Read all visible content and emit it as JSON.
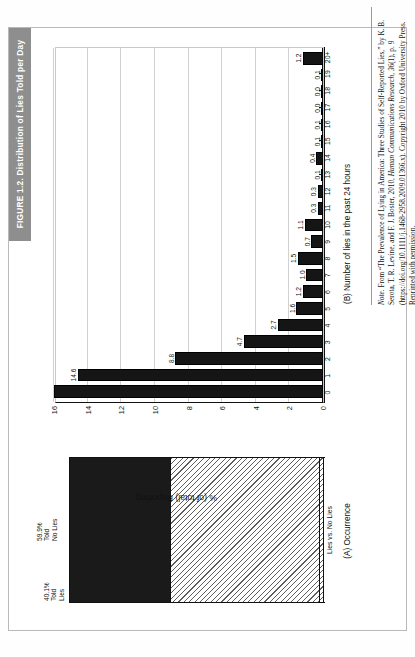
{
  "figure": {
    "title": "FIGURE 1.2. Distribution of Lies Told per Day",
    "title_bar_color": "#8e8e8e"
  },
  "panel_a": {
    "caption": "(A) Occurrence",
    "y_axis_label": "% (of total) Reporting",
    "x_tick_label": "Lies vs. No Lies",
    "segments": [
      {
        "label_lines": [
          "40.1%",
          "Told",
          "Lies"
        ],
        "value": 40.1,
        "fill": "solid-black"
      },
      {
        "label_lines": [
          "59.9%",
          "Told",
          "No Lies"
        ],
        "value": 59.9,
        "fill": "diagonal-hatch"
      }
    ]
  },
  "panel_b": {
    "caption": "(B) Number of lies in the past 24 hours",
    "y_axis_label": "% (of total) Reporting",
    "y_ticks": [
      "16",
      "14",
      "12",
      "10",
      "8",
      "6",
      "4",
      "2",
      "0"
    ]
  },
  "note": {
    "rule": true,
    "prefix": "Note.",
    "body_1": " From “The Prevalence of Lying in America: Three Studies of Self-Reported Lies,” by K. B. Serota, T. R. Levine, and F. J. Boster, 2010, ",
    "italic_1": "Human Communications Research, 36",
    "body_2": "(1), p. 9 (https://doi.org/10.1111/j.1468-2958.2009.01366.x). Copyright 2010 by Oxford University Press. Reprinted with permission."
  },
  "chart_data": {
    "type": "bar",
    "title": "FIGURE 1.2. Distribution of Lies Told per Day",
    "xlabel": "(B) Number of lies in the past 24 hours",
    "ylabel": "% (of total) Reporting",
    "ylim": [
      0,
      16
    ],
    "yticks": [
      0,
      2,
      4,
      6,
      8,
      10,
      12,
      14,
      16
    ],
    "grid": true,
    "legend": "none",
    "categories": [
      "0",
      "1",
      "2",
      "3",
      "4",
      "5",
      "6",
      "7",
      "8",
      "9",
      "10",
      "11",
      "12",
      "13",
      "14",
      "15",
      "16",
      "17",
      "18",
      "19",
      "20+"
    ],
    "values": [
      59.9,
      14.6,
      8.8,
      4.7,
      2.7,
      1.6,
      1.2,
      1.0,
      1.5,
      0.7,
      1.1,
      0.3,
      0.3,
      0.1,
      0.4,
      0.1,
      0.1,
      0.0,
      0.0,
      0.1,
      1.2
    ],
    "value_labels": [
      "",
      "14.6",
      "8.8",
      "4.7",
      "2.7",
      "1.6",
      "1.2",
      "1.0",
      "1.5",
      "0.7",
      "1.1",
      "0.3",
      "0.3",
      "0.1",
      "0.4",
      "0.1",
      "0.1",
      "0.0",
      "0.0",
      "0.1",
      "1.2"
    ],
    "note": "Category 0 is shown in panel A as 59.9% Told No Lies and is clipped in panel B.",
    "secondary_chart": {
      "type": "bar",
      "title": "(A) Occurrence",
      "categories": [
        "Lies vs. No Lies"
      ],
      "series": [
        {
          "name": "40.1% Told Lies",
          "values": [
            40.1
          ]
        },
        {
          "name": "59.9% Told No Lies",
          "values": [
            59.9
          ]
        }
      ],
      "ylabel": "% (of total) Reporting",
      "stacked": true
    }
  }
}
